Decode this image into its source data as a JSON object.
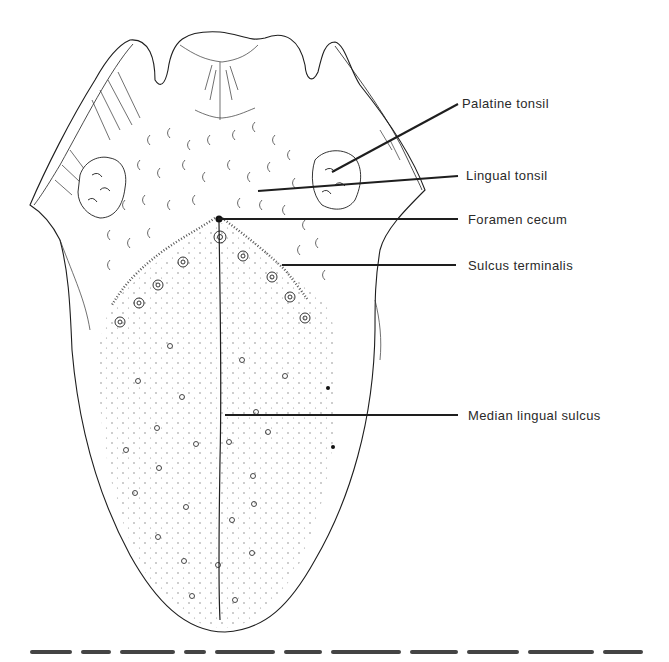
{
  "figure": {
    "labels": [
      {
        "id": "palatine-tonsil",
        "text": "Palatine tonsil",
        "x": 462,
        "y": 97,
        "line": [
          332,
          172,
          458,
          104
        ]
      },
      {
        "id": "lingual-tonsil",
        "text": "Lingual tonsil",
        "x": 466,
        "y": 169,
        "line": [
          258,
          191,
          458,
          176
        ]
      },
      {
        "id": "foramen-cecum",
        "text": "Foramen cecum",
        "x": 468,
        "y": 213,
        "line": [
          218,
          219,
          458,
          219
        ]
      },
      {
        "id": "sulcus-terminalis",
        "text": "Sulcus terminalis",
        "x": 468,
        "y": 259,
        "line": [
          282,
          265,
          456,
          265
        ]
      },
      {
        "id": "median-lingual-sulcus",
        "text": "Median lingual sulcus",
        "x": 468,
        "y": 409,
        "line": [
          225,
          415,
          458,
          415
        ]
      }
    ],
    "caption_visible": "cut off at bottom edge (illegible)"
  },
  "colors": {
    "ink": "#1e1e1e",
    "label_text": "#2a2a2a",
    "background": "#ffffff"
  }
}
